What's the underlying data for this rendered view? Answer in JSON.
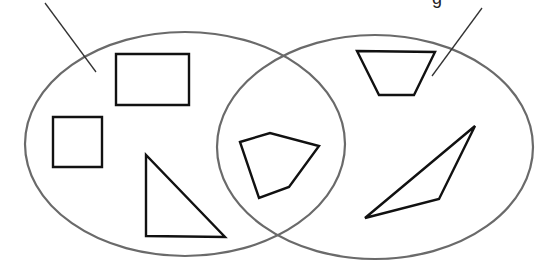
{
  "diagram": {
    "type": "venn",
    "sets": [
      {
        "id": "left",
        "cx": 185,
        "cy": 144,
        "rx": 160,
        "ry": 112,
        "stroke": "#6a6a6a"
      },
      {
        "id": "right",
        "cx": 375,
        "cy": 147,
        "rx": 158,
        "ry": 112,
        "stroke": "#6a6a6a"
      }
    ],
    "pointers": [
      {
        "id": "left-pointer",
        "x1": 45,
        "y1": 3,
        "x2": 96,
        "y2": 72
      },
      {
        "id": "right-pointer",
        "x1": 482,
        "y1": 8,
        "x2": 432,
        "y2": 76
      }
    ],
    "cut_off_labels": [
      {
        "id": "left-label",
        "text": "",
        "x": 120
      },
      {
        "id": "right-label",
        "text": "g",
        "x": 436
      }
    ],
    "shapes": [
      {
        "name": "rectangle",
        "region": "left-only",
        "points": "116,54 189,54 189,105 116,105"
      },
      {
        "name": "square",
        "region": "left-only",
        "points": "53,117 102,117 102,167 53,167"
      },
      {
        "name": "right-triangle",
        "region": "left-only",
        "points": "146,155 146,236 225,237"
      },
      {
        "name": "pentagon",
        "region": "intersection",
        "points": "240,142 270,133 319,146 289,187 259,198"
      },
      {
        "name": "trapezoid",
        "region": "right-only",
        "points": "357,51 435,52 414,95 379,95"
      },
      {
        "name": "obtuse-triangle",
        "region": "right-only",
        "points": "365,218 475,126 439,199"
      }
    ],
    "colors": {
      "background": "#ffffff",
      "set_stroke": "#6a6a6a",
      "shape_stroke": "#111111",
      "pointer_stroke": "#333333"
    }
  }
}
